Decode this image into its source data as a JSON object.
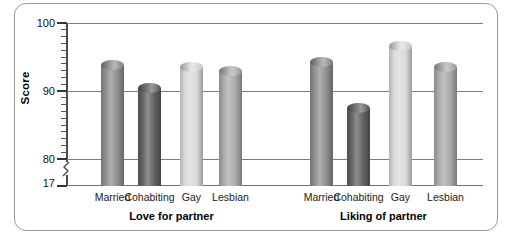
{
  "chart_data": {
    "type": "bar",
    "title": "",
    "subtitle": "",
    "xlabel": "",
    "ylabel": "Score",
    "ylim": [
      17,
      100
    ],
    "y_axis_break": true,
    "y_break_from": 17,
    "y_break_to": 80,
    "y_ticks_major": [
      "100",
      "90",
      "80",
      "17"
    ],
    "y_tick_values": [
      100,
      90,
      80,
      17
    ],
    "y_minor_tick_step": 1,
    "grid": "horizontal",
    "gridlines_at": [
      100,
      90,
      80
    ],
    "legend": "none",
    "categories": [
      "Married",
      "Cohabiting",
      "Gay",
      "Lesbian"
    ],
    "groups": [
      "Love for partner",
      "Liking of partner"
    ],
    "series": [
      {
        "name": "Love for partner",
        "values": [
          94.5,
          91.2,
          94.3,
          93.7
        ]
      },
      {
        "name": "Liking of partner",
        "values": [
          95.0,
          88.2,
          97.3,
          94.3
        ]
      }
    ],
    "bar_colors": {
      "Married": "#8c8c8c",
      "Cohabiting": "#5e5e5e",
      "Gay": "#d9d9d9",
      "Lesbian": "#a8a8a8"
    }
  },
  "axis": {
    "y_title": "Score",
    "tick_100": "100",
    "tick_90": "90",
    "tick_80": "80",
    "tick_17": "17"
  },
  "groups": [
    {
      "label": "Love for partner",
      "bars": [
        {
          "label": "Married",
          "value": 94.5
        },
        {
          "label": "Cohabiting",
          "value": 91.2
        },
        {
          "label": "Gay",
          "value": 94.3
        },
        {
          "label": "Lesbian",
          "value": 93.7
        }
      ]
    },
    {
      "label": "Liking of partner",
      "bars": [
        {
          "label": "Married",
          "value": 95.0
        },
        {
          "label": "Cohabiting",
          "value": 88.2
        },
        {
          "label": "Gay",
          "value": 97.3
        },
        {
          "label": "Lesbian",
          "value": 94.3
        }
      ]
    }
  ],
  "colors": {
    "frame_border": "#9a9a9a",
    "gridline": "#7d7d7d",
    "axis": "#4a4a4a",
    "text": "#111111"
  }
}
